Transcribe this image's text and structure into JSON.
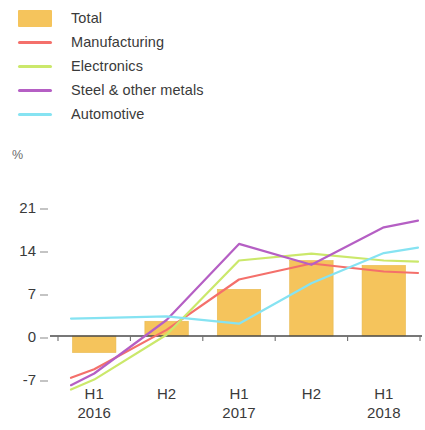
{
  "legend": {
    "items": [
      {
        "label": "Total",
        "color": "#f5c45c",
        "marker": "box"
      },
      {
        "label": "Manufacturing",
        "color": "#f4706b",
        "marker": "line"
      },
      {
        "label": "Electronics",
        "color": "#cbe86b",
        "marker": "line"
      },
      {
        "label": "Steel & other metals",
        "color": "#b55fc4",
        "marker": "line"
      },
      {
        "label": "Automotive",
        "color": "#86e3f2",
        "marker": "line"
      }
    ]
  },
  "axes": {
    "y_unit": "%",
    "y_ticks": [
      "21",
      "14",
      "7",
      "0",
      "-7"
    ],
    "x_ticks": [
      {
        "half": "H1",
        "year": "2016"
      },
      {
        "half": "H2",
        "year": ""
      },
      {
        "half": "H1",
        "year": "2017"
      },
      {
        "half": "H2",
        "year": ""
      },
      {
        "half": "H1",
        "year": "2018"
      }
    ]
  },
  "chart_data": {
    "type": "bar",
    "title": "",
    "xlabel": "",
    "ylabel": "%",
    "ylim": [
      -8,
      21
    ],
    "yticks": [
      -7,
      0,
      7,
      14,
      21
    ],
    "grid": false,
    "legend_position": "top-left",
    "categories": [
      "H1 2016",
      "H2 2016",
      "H1 2017",
      "H2 2017",
      "H1 2018"
    ],
    "series": [
      {
        "name": "Total",
        "type": "bar",
        "color": "#f5c45c",
        "values": [
          -2.7,
          2.4,
          7.6,
          12.3,
          11.5
        ]
      },
      {
        "name": "Manufacturing",
        "type": "line",
        "color": "#f4706b",
        "values": [
          -5.4,
          1.0,
          9.2,
          11.8,
          10.5
        ]
      },
      {
        "name": "Electronics",
        "type": "line",
        "color": "#cbe86b",
        "values": [
          -7.1,
          0.2,
          12.3,
          13.4,
          12.3
        ]
      },
      {
        "name": "Steel & other metals",
        "type": "line",
        "color": "#b55fc4",
        "values": [
          -6.1,
          2.6,
          15.0,
          11.6,
          17.7
        ]
      },
      {
        "name": "Automotive",
        "type": "line",
        "color": "#86e3f2",
        "values": [
          2.9,
          3.2,
          2.0,
          8.6,
          13.5
        ]
      }
    ]
  }
}
